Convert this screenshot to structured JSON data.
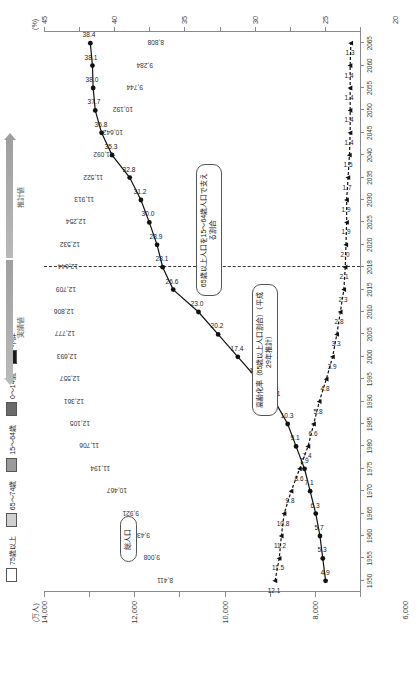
{
  "axes": {
    "y_unit": "(万人)",
    "y_ticks": [
      "0",
      "2,000",
      "4,000",
      "6,000",
      "8,000",
      "10,000",
      "12,000",
      "14,000"
    ],
    "y_max": 14000,
    "p_unit": "(%)",
    "p_ticks": [
      "0",
      "5",
      "10",
      "15",
      "20",
      "25",
      "30",
      "35",
      "40",
      "45"
    ],
    "p_max": 45,
    "x_unit": "(年)"
  },
  "legend": {
    "items": [
      {
        "label": "75歳以上",
        "color": "#ffffff",
        "name": "legend-75-plus"
      },
      {
        "label": "65～74歳",
        "color": "#cfcfcf",
        "name": "legend-65-74"
      },
      {
        "label": "15～64歳",
        "color": "#9a9a9a",
        "name": "legend-15-64"
      },
      {
        "label": "0～14歳",
        "color": "#6b6b6b",
        "name": "legend-0-14"
      },
      {
        "label": "不詳",
        "color": "#1a1a1a",
        "name": "legend-unknown"
      }
    ],
    "arrow_actual": "実績値",
    "arrow_estimate": "推計値"
  },
  "callouts": {
    "total_population": "総人口",
    "aging_rate": "高齢化率（65歳以上人口割合）（平成29年推計）",
    "support_ratio": "65歳以上人口を15～64歳人口で支える割合"
  },
  "chart_data": {
    "type": "bar",
    "xlabel": "(年)",
    "ylabel": "(万人)",
    "ylim": [
      0,
      14000
    ],
    "y2lim": [
      0,
      45
    ],
    "y2label": "(%)",
    "grid": false,
    "legend_position": "top",
    "categories": [
      "1950",
      "1955",
      "1960",
      "1965",
      "1970",
      "1975",
      "1980",
      "1985",
      "1990",
      "1995",
      "2000",
      "2005",
      "2010",
      "2015",
      "2018",
      "2020",
      "2025",
      "2030",
      "2035",
      "2040",
      "2045",
      "2050",
      "2055",
      "2060",
      "2065"
    ],
    "totals": [
      8411,
      9008,
      9430,
      9921,
      10467,
      11194,
      11706,
      12105,
      12361,
      12557,
      12693,
      12777,
      12806,
      12709,
      12644,
      12532,
      12254,
      11913,
      11522,
      11092,
      10642,
      10192,
      9744,
      9284,
      8808
    ],
    "series": [
      {
        "name": "0～14歳",
        "key": "age0_14",
        "color": "#6b6b6b",
        "values": [
          2979,
          3012,
          2843,
          2553,
          2515,
          2722,
          2751,
          2603,
          2249,
          2003,
          1851,
          1759,
          1684,
          1595,
          1542,
          1503,
          1407,
          1321,
          1246,
          1194,
          1138,
          1077,
          1012,
          951,
          898
        ]
      },
      {
        "name": "15～64歳",
        "key": "age15_64",
        "color": "#9a9a9a",
        "values": [
          5017,
          5517,
          6047,
          6744,
          7212,
          7581,
          7883,
          8251,
          8590,
          8716,
          8622,
          8409,
          8103,
          7728,
          7545,
          7406,
          7170,
          6875,
          6494,
          5978,
          5584,
          5275,
          4950,
          4529,
          4189
        ]
      },
      {
        "name": "65～74歳",
        "key": "age65_74",
        "color": "#cfcfcf",
        "values": [
          309,
          338,
          376,
          425,
          516,
          601,
          699,
          776,
          892,
          1109,
          1301,
          1407,
          1517,
          1752,
          1760,
          1747,
          1497,
          1428,
          1522,
          1681,
          1643,
          1424,
          1258,
          1154,
          1133
        ]
      },
      {
        "name": "75歳以上",
        "key": "age75_plus",
        "color": "#ffffff",
        "values": [
          107,
          139,
          164,
          189,
          221,
          284,
          366,
          471,
          597,
          717,
          900,
          1160,
          1407,
          1632,
          1798,
          1872,
          2180,
          2288,
          2260,
          2239,
          2277,
          2417,
          2446,
          2387,
          2248
        ]
      },
      {
        "name": "不詳",
        "key": "unknown",
        "color": "#1a1a1a",
        "values": [
          0,
          0,
          0,
          9,
          3,
          6,
          7,
          4,
          30,
          12,
          19,
          42,
          95,
          2,
          0,
          0,
          0,
          0,
          0,
          0,
          0,
          0,
          0,
          0,
          0
        ]
      }
    ],
    "aging_rate": {
      "name": "高齢化率（65歳以上人口割合）",
      "values": [
        4.9,
        5.3,
        5.7,
        6.3,
        7.1,
        7.9,
        9.1,
        10.3,
        12.1,
        14.6,
        17.4,
        20.2,
        23.0,
        26.6,
        28.1,
        28.9,
        30.0,
        31.2,
        32.8,
        35.3,
        36.8,
        37.7,
        38.0,
        38.1,
        38.4
      ]
    },
    "support_ratio": {
      "name": "65歳以上人口を15～64歳人口で支える割合",
      "values": [
        12.1,
        11.5,
        11.2,
        10.8,
        9.8,
        8.6,
        7.4,
        6.6,
        5.8,
        4.8,
        3.9,
        3.3,
        2.8,
        2.3,
        2.1,
        2.0,
        1.9,
        1.9,
        1.7,
        1.5,
        1.4,
        1.4,
        1.4,
        1.4,
        1.3
      ]
    },
    "divider_year": "2018"
  }
}
